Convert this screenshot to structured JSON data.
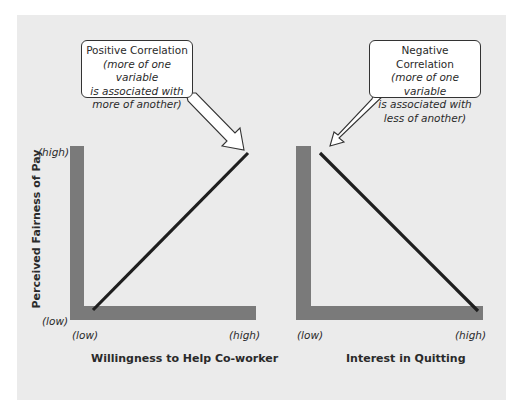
{
  "panels": [
    {
      "id": "positive",
      "callout": {
        "title": "Positive Correlation",
        "description_lines": [
          "(more of one variable",
          "is associated with",
          "more of another)"
        ]
      },
      "y_axis": {
        "label": "Perceived Fairness of Pay",
        "high": "(high)",
        "low": "(low)"
      },
      "x_axis": {
        "label": "Willingness to Help Co-worker",
        "low": "(low)",
        "high": "(high)"
      },
      "trend": "positive"
    },
    {
      "id": "negative",
      "callout": {
        "title": "Negative Correlation",
        "description_lines": [
          "(more of one variable",
          "is associated with",
          "less of another)"
        ]
      },
      "x_axis": {
        "label": "Interest in Quitting",
        "low": "(low)",
        "high": "(high)"
      },
      "trend": "negative"
    }
  ],
  "colors": {
    "background": "#ebebeb",
    "axis_bar": "#7a7a7a",
    "trend_line": "#1e1e1e",
    "callout_fill": "#ffffff",
    "callout_border": "#333333"
  }
}
